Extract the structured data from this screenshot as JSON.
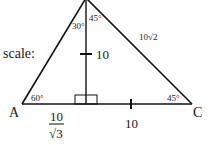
{
  "diagram": {
    "scale_label": "scale:",
    "vertices": {
      "A": "A",
      "C": "C"
    },
    "angles": {
      "A": "60°",
      "C": "45°",
      "apex_left": "30°",
      "apex_right": "45°"
    },
    "sides": {
      "hypotenuse_right": "10√2",
      "altitude": "10",
      "base_right": "10",
      "base_left_num": "10",
      "base_left_den": "√3"
    },
    "colors": {
      "line": "#111111",
      "background": "#ffffff"
    }
  }
}
